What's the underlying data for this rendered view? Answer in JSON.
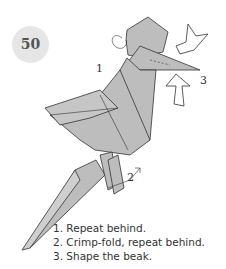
{
  "step": {
    "number": "50"
  },
  "callouts": {
    "one": "1",
    "two": "2",
    "three": "3"
  },
  "instructions": [
    "1. Repeat behind.",
    "2. Crimp-fold, repeat behind.",
    "3. Shape the beak."
  ],
  "colors": {
    "paper": "#bdbdbd",
    "stroke": "#333333",
    "badge": "#e6e6e6"
  }
}
